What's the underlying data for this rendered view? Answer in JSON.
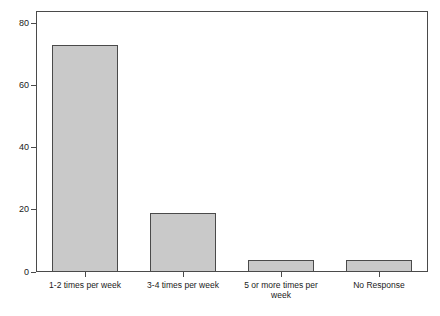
{
  "chart_data": {
    "type": "bar",
    "title": "",
    "subtitle": "",
    "xlabel": "",
    "ylabel": "",
    "categories": [
      "1-2 times per week",
      "3-4 times per week",
      "5 or more times per week",
      "No Response"
    ],
    "values": [
      73,
      19,
      4,
      4
    ],
    "ylim": [
      0,
      80
    ],
    "yticks": [
      0,
      20,
      40,
      60,
      80
    ],
    "ytick_labels": [
      "0",
      "20",
      "40",
      "60",
      "80"
    ],
    "grid": false,
    "legend": null,
    "bar_fill_color": "#c9c9c9",
    "bar_edge_color": "#4a4a4a",
    "axis_color": "#4a4a4a",
    "background_color": "#ffffff",
    "text_color": "#1a1a1a"
  }
}
